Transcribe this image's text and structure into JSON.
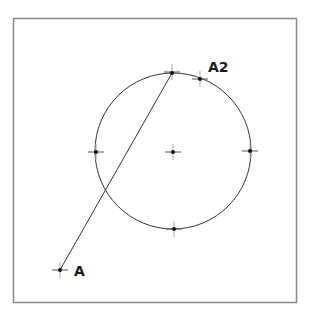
{
  "diagram": {
    "frame": {
      "x": 13,
      "y": 18,
      "width": 283,
      "height": 284,
      "stroke": "#888888"
    },
    "circle": {
      "cx": 173,
      "cy": 151,
      "r": 78,
      "stroke": "#333333"
    },
    "points": [
      {
        "id": "center",
        "x": 173,
        "y": 152,
        "label": ""
      },
      {
        "id": "top",
        "x": 172,
        "y": 73,
        "label": ""
      },
      {
        "id": "bottom",
        "x": 174,
        "y": 229,
        "label": ""
      },
      {
        "id": "left",
        "x": 96,
        "y": 152,
        "label": ""
      },
      {
        "id": "right",
        "x": 250,
        "y": 151,
        "label": ""
      },
      {
        "id": "A2",
        "x": 200,
        "y": 79,
        "label": "A2"
      },
      {
        "id": "A",
        "x": 60,
        "y": 270,
        "label": "A"
      }
    ],
    "line": {
      "from": "A",
      "to": "top",
      "x1": 60,
      "y1": 270,
      "x2": 172,
      "y2": 73
    },
    "labels": {
      "a2": "A2",
      "a": "A"
    }
  }
}
